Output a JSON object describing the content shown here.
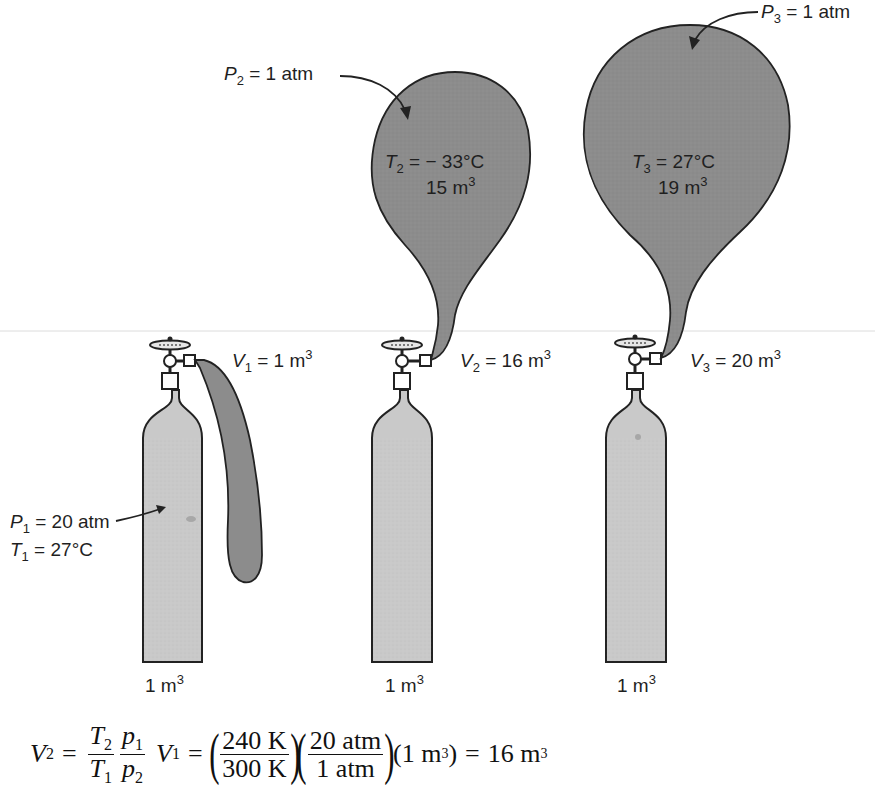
{
  "figure": {
    "colors": {
      "cylinder_fill": "#c9c9c9",
      "balloon_fill": "#8c8c8c",
      "outline": "#222222",
      "background": "#ffffff",
      "baseline": "#d8d8d8"
    },
    "cylinders": [
      {
        "id": 1,
        "volume_label": "1 m",
        "volume_exp": "3",
        "gas_volume": {
          "var": "V",
          "sub": "1",
          "text": " = 1 m",
          "exp": "3"
        },
        "pressure": {
          "var": "P",
          "sub": "1",
          "text": " = 20 atm"
        },
        "temperature": {
          "var": "T",
          "sub": "1",
          "text": " = 27°C"
        }
      },
      {
        "id": 2,
        "volume_label": "1 m",
        "volume_exp": "3",
        "gas_volume": {
          "var": "V",
          "sub": "2",
          "text": " = 16 m",
          "exp": "3"
        },
        "balloon": {
          "pressure": {
            "var": "P",
            "sub": "2",
            "text": " = 1 atm"
          },
          "temperature": {
            "var": "T",
            "sub": "2",
            "text": " = − 33°C"
          },
          "volume": {
            "text": "15 m",
            "exp": "3"
          }
        }
      },
      {
        "id": 3,
        "volume_label": "1 m",
        "volume_exp": "3",
        "gas_volume": {
          "var": "V",
          "sub": "3",
          "text": " = 20 m",
          "exp": "3"
        },
        "balloon": {
          "pressure": {
            "var": "P",
            "sub": "3",
            "text": " = 1 atm"
          },
          "temperature": {
            "var": "T",
            "sub": "3",
            "text": " = 27°C"
          },
          "volume": {
            "text": "19 m",
            "exp": "3"
          }
        }
      }
    ],
    "equation": {
      "lhs_var": "V",
      "lhs_sub": "2",
      "eq1": "=",
      "f1_num_var": "T",
      "f1_num_sub": "2",
      "f1_den_var": "T",
      "f1_den_sub": "1",
      "f2_num_var": "p",
      "f2_num_sub": "1",
      "f2_den_var": "p",
      "f2_den_sub": "2",
      "v1_var": "V",
      "v1_sub": "1",
      "eq2": "=",
      "f3_num": "240 K",
      "f3_den": "300 K",
      "f4_num": "20 atm",
      "f4_den": "1 atm",
      "factor": "(1 m",
      "factor_exp": "3",
      "factor_close": ")",
      "eq3": "=",
      "result": "16 m",
      "result_exp": "3"
    }
  }
}
